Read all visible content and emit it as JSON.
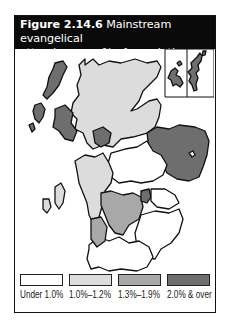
{
  "figure": {
    "number": "Figure 2.14.6",
    "title": "Mainstream evangelical attendance as % of population, 1994",
    "title_line1": "Mainstream evangelical",
    "title_line2": "attendance as % of population, 1994"
  },
  "map": {
    "region": "Scotland",
    "inset": "Orkney and Shetland islands",
    "colors": {
      "under_1_0": "#ffffff",
      "1_0_to_1_2": "#dcdcdc",
      "1_3_to_1_9": "#a8a8a8",
      "2_0_and_over": "#6e6e6e",
      "outline": "#111111"
    },
    "regions": [
      {
        "name": "Western Isles",
        "class": "2.0% & over"
      },
      {
        "name": "Highland",
        "class": "1.0%-1.2%"
      },
      {
        "name": "Grampian",
        "class": "2.0% & over"
      },
      {
        "name": "Orkney",
        "class": "2.0% & over"
      },
      {
        "name": "Shetland",
        "class": "2.0% & over"
      },
      {
        "name": "Tayside",
        "class": "Under 1.0%"
      },
      {
        "name": "Argyll",
        "class": "1.0%-1.2%"
      },
      {
        "name": "Skye",
        "class": "2.0% & over"
      },
      {
        "name": "Central Belt West",
        "class": "1.3%-1.9%"
      },
      {
        "name": "Central Belt East",
        "class": "2.0% & over"
      },
      {
        "name": "Borders",
        "class": "Under 1.0%"
      },
      {
        "name": "Dumfries & Galloway",
        "class": "Under 1.0%"
      }
    ]
  },
  "legend": {
    "items": [
      {
        "label": "Under 1.0%",
        "color": "#ffffff"
      },
      {
        "label": "1.0%–1.2%",
        "color": "#dcdcdc"
      },
      {
        "label": "1.3%–1.9%",
        "color": "#a8a8a8"
      },
      {
        "label": "2.0% & over",
        "color": "#6e6e6e"
      }
    ]
  }
}
